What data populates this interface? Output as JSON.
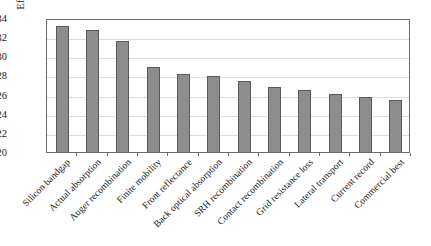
{
  "chart_data": {
    "type": "bar",
    "title": "",
    "subtitle": "",
    "xlabel": "",
    "ylabel": "Efficiency (%)",
    "ylim": [
      20,
      34
    ],
    "yticks": [
      20,
      22,
      24,
      26,
      28,
      30,
      32,
      34
    ],
    "ytick_labels": [
      "20",
      "22",
      "24",
      "26",
      "28",
      "30",
      "32",
      "34"
    ],
    "grid": true,
    "grid_axis": "y",
    "legend": false,
    "legend_position": "none",
    "bar_color": "#8d8d8d",
    "bar_edge_color": "#59595b",
    "categories": [
      "Silicon bandgap",
      "Actual absorption",
      "Auger recombination",
      "Finite mobility",
      "Front reflectance",
      "Back optical absorption",
      "SRH recombination",
      "Contact recombination",
      "Grid resistance loss",
      "Lateral transport",
      "Current record",
      "Commercial best"
    ],
    "values": [
      33.2,
      32.7,
      31.6,
      28.9,
      28.2,
      27.9,
      27.4,
      26.8,
      26.5,
      26.1,
      25.8,
      25.4
    ]
  }
}
